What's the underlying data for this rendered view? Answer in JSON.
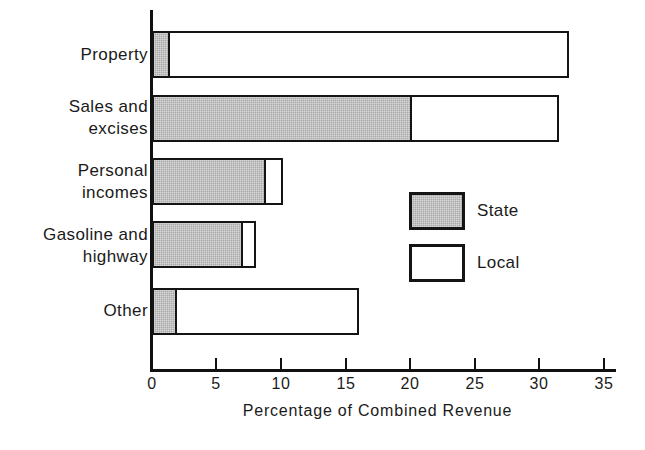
{
  "chart_data": {
    "type": "bar",
    "orientation": "horizontal",
    "stacked": true,
    "title": "",
    "xlabel": "Percentage of Combined Revenue",
    "ylabel": "",
    "xlim": [
      0,
      35
    ],
    "xticks": [
      0,
      5,
      10,
      15,
      20,
      25,
      30,
      35
    ],
    "xtick_labels": [
      "0",
      "5",
      "10",
      "15",
      "20",
      "25",
      "30",
      "35"
    ],
    "grid": false,
    "categories": [
      "Property",
      "Sales and excises",
      "Personal incomes",
      "Gasoline and highway",
      "Other"
    ],
    "category_label_lines": [
      [
        "Property"
      ],
      [
        "Sales and",
        "excises"
      ],
      [
        "Personal",
        "incomes"
      ],
      [
        "Gasoline and",
        "highway"
      ],
      [
        "Other"
      ]
    ],
    "series": [
      {
        "name": "State",
        "color": "#a9a9a9",
        "values": [
          1.4,
          20.2,
          8.9,
          7.1,
          2.0
        ]
      },
      {
        "name": "Local",
        "color": "#ffffff",
        "values": [
          31.0,
          11.4,
          1.3,
          1.0,
          14.1
        ]
      }
    ],
    "totals": [
      32.4,
      31.6,
      10.2,
      8.1,
      16.1
    ],
    "legend": {
      "position": "inside-right",
      "entries": [
        {
          "label": "State",
          "swatch": "state-swatch"
        },
        {
          "label": "Local",
          "swatch": "local-swatch"
        }
      ]
    },
    "colors": {
      "state_fill": "#a9a9a9",
      "local_fill": "#ffffff",
      "outline": "#141414",
      "axis": "#111111",
      "text": "#1a1a1a",
      "background": "#ffffff"
    }
  }
}
